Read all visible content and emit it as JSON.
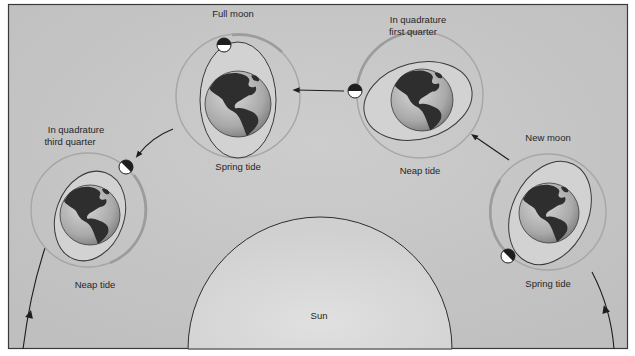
{
  "diagram": {
    "colors": {
      "background": "#c4c4c4",
      "frame": "#3a3a3a",
      "sun_fill": "#d6d6d6",
      "orbit": "#a8a8a8",
      "orbit_active": "#9a9a9a",
      "tide_bulge": "#d0d0d0",
      "earth_ocean": "#bdbdbd",
      "earth_land": "#2e2e2e",
      "arrow": "#1e1e1e"
    },
    "sun": {
      "label": "Sun"
    },
    "positions": [
      {
        "id": "full-moon",
        "phase_label": "Full moon",
        "phase_label_line2": "",
        "tide_label": "Spring tide",
        "moon_icon": "moon-full-icon"
      },
      {
        "id": "first-quarter",
        "phase_label": "In quadrature",
        "phase_label_line2": "first quarter",
        "tide_label": "Neap tide",
        "moon_icon": "moon-first-quarter-icon"
      },
      {
        "id": "third-quarter",
        "phase_label": "In quadrature",
        "phase_label_line2": "third quarter",
        "tide_label": "Neap tide",
        "moon_icon": "moon-third-quarter-icon"
      },
      {
        "id": "new-moon",
        "phase_label": "New moon",
        "phase_label_line2": "",
        "tide_label": "Spring tide",
        "moon_icon": "moon-new-icon"
      }
    ],
    "arrows": [
      {
        "from": "new-moon",
        "to": "first-quarter",
        "icon": "arrow-icon"
      },
      {
        "from": "first-quarter",
        "to": "full-moon",
        "icon": "arrow-icon"
      },
      {
        "from": "full-moon",
        "to": "third-quarter",
        "icon": "arrow-icon"
      }
    ]
  }
}
